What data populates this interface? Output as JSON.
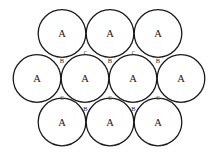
{
  "diagram": {
    "background_color": "#ffffff",
    "sphere_fill_color": "#ffffff",
    "sphere_stroke_color": "#1b1b1b",
    "label_color": "#161616",
    "canvas_width": 215,
    "canvas_height": 158,
    "sphere_radius": 23.8,
    "sphere_label": "A",
    "sphere_label_font_size": 10.5,
    "spheres": [
      {
        "label": "A",
        "x": 62,
        "y": 33.5
      },
      {
        "label": "A",
        "x": 110,
        "y": 33.5
      },
      {
        "label": "A",
        "x": 158,
        "y": 33.5
      },
      {
        "label": "A",
        "x": 37,
        "y": 78.5
      },
      {
        "label": "A",
        "x": 85,
        "y": 78.5
      },
      {
        "label": "A",
        "x": 133,
        "y": 78.5
      },
      {
        "label": "A",
        "x": 181,
        "y": 78.5
      },
      {
        "label": "A",
        "x": 62,
        "y": 122
      },
      {
        "label": "A",
        "x": 110,
        "y": 122
      },
      {
        "label": "A",
        "x": 158,
        "y": 122
      }
    ],
    "interstitial_sites": [
      {
        "label": "B",
        "x": 62,
        "y": 60,
        "font_size": 6.5,
        "void_orientation": "down"
      },
      {
        "label": "B",
        "x": 110,
        "y": 60,
        "font_size": 6.5,
        "void_orientation": "down"
      },
      {
        "label": "B",
        "x": 158,
        "y": 60,
        "font_size": 6.5,
        "void_orientation": "down"
      },
      {
        "label": "C",
        "x": 85.5,
        "y": 53,
        "font_size": 5.5,
        "void_orientation": "up"
      },
      {
        "label": "C",
        "x": 133.5,
        "y": 53,
        "font_size": 5.5,
        "void_orientation": "up"
      },
      {
        "label": "B",
        "x": 85.5,
        "y": 108.5,
        "font_size": 6.5,
        "void_orientation": "down"
      },
      {
        "label": "B",
        "x": 133.5,
        "y": 108.5,
        "font_size": 6.5,
        "void_orientation": "down"
      },
      {
        "label": "C",
        "x": 62,
        "y": 97.5,
        "font_size": 5.5,
        "void_orientation": "up"
      },
      {
        "label": "C",
        "x": 110,
        "y": 97.5,
        "font_size": 5.5,
        "void_orientation": "up"
      },
      {
        "label": "C",
        "x": 158,
        "y": 97.5,
        "font_size": 5.5,
        "void_orientation": "up"
      }
    ]
  }
}
